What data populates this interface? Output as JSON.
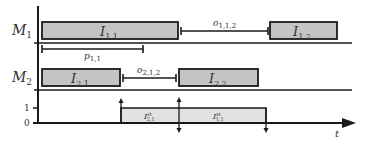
{
  "axes": {
    "machine_labels": [
      {
        "main": "M",
        "sub": "1"
      },
      {
        "main": "M",
        "sub": "2"
      }
    ],
    "level_ticks": [
      "1",
      "0"
    ],
    "time_label": "t"
  },
  "operations": [
    {
      "id": "I11",
      "main": "I",
      "sub": "1,1",
      "machine": 1
    },
    {
      "id": "I12",
      "main": "I",
      "sub": "1,2",
      "machine": 1
    },
    {
      "id": "I21",
      "main": "I",
      "sub": "2,1",
      "machine": 2
    },
    {
      "id": "I22",
      "main": "I",
      "sub": "2,2",
      "machine": 2
    }
  ],
  "intervals": [
    {
      "id": "o112",
      "main": "o",
      "sub": "1,1,2"
    },
    {
      "id": "o212",
      "main": "o",
      "sub": "2,1,2"
    },
    {
      "id": "p11",
      "main": "p",
      "sub": "1,1"
    }
  ],
  "step": [
    {
      "id": "Ist21",
      "main": "I",
      "sup": "st",
      "sub": "2,1"
    },
    {
      "id": "Ist11",
      "main": "I",
      "sup": "st",
      "sub": "1,1"
    }
  ],
  "colors": {
    "box_fill": "#c4c4c4",
    "step_fill": "#e2e2e2",
    "stroke": "#1a1a1a"
  }
}
